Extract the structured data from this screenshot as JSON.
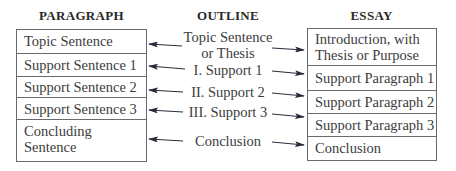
{
  "headers": {
    "paragraph": "PARAGRAPH",
    "outline": "OUTLINE",
    "essay": "ESSAY"
  },
  "paragraph": {
    "rows": [
      {
        "lines": [
          "Topic Sentence"
        ]
      },
      {
        "lines": [
          "Support Sentence 1"
        ]
      },
      {
        "lines": [
          "Support Sentence 2"
        ]
      },
      {
        "lines": [
          "Support Sentence 3"
        ]
      },
      {
        "lines": [
          "Concluding",
          "Sentence"
        ]
      }
    ]
  },
  "outline": {
    "items": [
      {
        "lines": [
          "Topic Sentence",
          "or Thesis"
        ]
      },
      {
        "lines": [
          "I. Support 1"
        ]
      },
      {
        "lines": [
          "II. Support 2"
        ]
      },
      {
        "lines": [
          "III. Support 3"
        ]
      },
      {
        "lines": [
          "Conclusion"
        ]
      }
    ]
  },
  "essay": {
    "rows": [
      {
        "lines": [
          "Introduction, with",
          "Thesis or Purpose"
        ]
      },
      {
        "lines": [
          "Support Paragraph 1"
        ]
      },
      {
        "lines": [
          "Support Paragraph 2"
        ]
      },
      {
        "lines": [
          "Support Paragraph 3"
        ]
      },
      {
        "lines": [
          "Conclusion"
        ]
      }
    ]
  },
  "colors": {
    "border": "#6a6a6a",
    "text": "#3c3c3c",
    "arrow": "#2a2a3a"
  }
}
